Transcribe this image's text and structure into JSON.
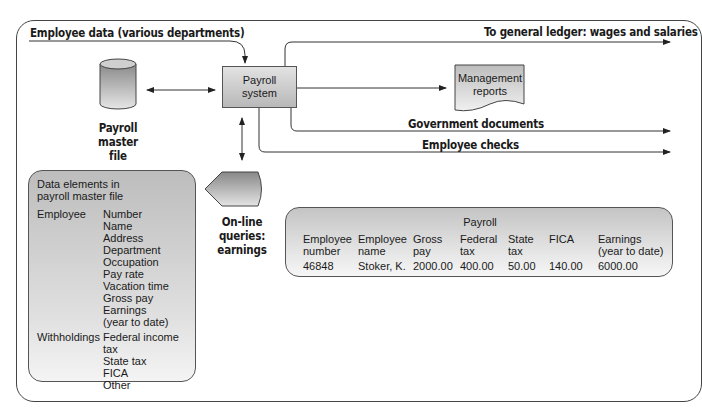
{
  "diagram": {
    "input_label": "Employee data (various departments)",
    "process": {
      "line1": "Payroll",
      "line2": "system"
    },
    "master_file": {
      "line1": "Payroll",
      "line2": "master",
      "line3": "file"
    },
    "outputs": {
      "general_ledger": "To general ledger: wages and salaries",
      "management_reports": {
        "line1": "Management",
        "line2": "reports"
      },
      "government_documents": "Government documents",
      "employee_checks": "Employee checks"
    },
    "queries": {
      "line1": "On-line",
      "line2": "queries:",
      "line3": "earnings"
    }
  },
  "data_elements": {
    "title_line1": "Data elements in",
    "title_line2": "payroll master file",
    "groups": [
      {
        "label": "Employee",
        "items": [
          "Number",
          "Name",
          "Address",
          "Department",
          "Occupation",
          "Pay rate",
          "Vacation time",
          "Gross pay",
          "Earnings",
          "(year to date)"
        ]
      },
      {
        "label": "Withholdings",
        "items": [
          "Federal income tax",
          "State tax",
          "FICA",
          "Other"
        ]
      }
    ]
  },
  "payroll_table": {
    "title": "Payroll",
    "headers": [
      {
        "l1": "Employee",
        "l2": "number"
      },
      {
        "l1": "Employee",
        "l2": "name"
      },
      {
        "l1": "Gross",
        "l2": "pay"
      },
      {
        "l1": "Federal",
        "l2": "tax"
      },
      {
        "l1": "State",
        "l2": "tax"
      },
      {
        "l1": "FICA",
        "l2": ""
      },
      {
        "l1": "Earnings",
        "l2": "(year to date)"
      }
    ],
    "row": [
      "46848",
      "Stoker, K.",
      "2000.00",
      "400.00",
      "50.00",
      "140.00",
      "6000.00"
    ]
  }
}
